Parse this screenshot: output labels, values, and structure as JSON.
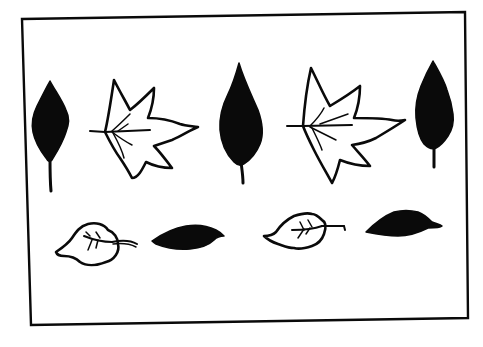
{
  "canvas": {
    "width": 483,
    "height": 347,
    "background": "#ffffff"
  },
  "colors": {
    "ink": "#0a0a0a",
    "paper": "#ffffff"
  },
  "frame": {
    "points": "22,19 465,12 468,318 31,325",
    "stroke_width": 2.4
  },
  "pattern_description": "Two rows of alternating leaves: top row dark oval leaf, outlined maple leaf, dark leaf, outlined maple leaf, dark leaf; bottom row outlined round leaf, dark horizontal leaf, outlined round leaf, dark horizontal leaf",
  "leaves": [
    {
      "name": "dark-leaf-1",
      "kind": "solid",
      "body": "M50,81 C56,92 62,100 66,110 C70,118 69,124 66,132 C63,142 58,150 52,160 C50,162 48,162 46,158 C40,150 35,142 33,132 C31,122 33,114 37,106 C42,96 46,88 50,81 Z",
      "stem": "M50,158 C50,170 50,180 51,191"
    },
    {
      "name": "maple-leaf-1",
      "kind": "outline",
      "body": "M105,132 C108,120 111,100 114,80 C120,92 126,102 130,110 C138,104 146,96 154,88 C154,98 152,108 148,118 C160,118 170,120 180,124 C186,126 192,126 198,127 C190,130 182,136 172,140 C166,142 160,144 154,146 C160,152 166,160 172,168 C164,168 154,166 146,162 C142,170 138,178 132,178 C128,170 124,164 120,158 C114,150 110,142 105,132 Z",
      "veins": [
        "M90,131 L105,132",
        "M105,132 L150,130",
        "M112,131 C120,124 126,118 130,114",
        "M112,132 C120,138 126,142 132,145",
        "M113,133 C118,142 122,150 124,158",
        "M118,131 L128,124"
      ]
    },
    {
      "name": "dark-leaf-2",
      "kind": "solid",
      "body": "M239,63 C244,80 252,96 258,110 C263,124 264,134 260,144 C256,154 250,160 244,164 C241,166 238,166 234,162 C226,154 221,142 220,130 C219,116 223,104 228,94 C233,84 236,74 239,63 Z",
      "stem": "M241,162 C242,170 243,176 243,183"
    },
    {
      "name": "maple-leaf-2",
      "kind": "outline",
      "body": "M303,126 C304,112 306,90 311,68 C318,82 324,96 330,106 C340,100 350,94 360,86 C360,98 358,108 354,118 C368,118 382,118 392,120 C396,121 400,121 405,120 C396,126 386,132 376,138 C368,142 360,144 352,145 C358,152 364,158 370,166 C360,166 350,164 340,160 C338,168 336,176 332,183 C326,172 320,162 314,150 C310,142 306,134 303,126 Z",
      "veins": [
        "M287,126 L303,126",
        "M303,126 L352,125",
        "M310,126 C318,118 322,112 324,108",
        "M310,127 C320,132 328,136 336,140",
        "M312,128 C316,136 320,144 322,150",
        "M320,124 L348,114"
      ]
    },
    {
      "name": "dark-leaf-3",
      "kind": "solid",
      "body": "M433,61 C438,70 444,80 447,90 C450,98 452,106 453,114 C454,122 452,130 448,136 C444,142 440,146 436,148 C432,150 428,148 424,144 C419,138 417,128 416,118 C415,106 417,96 421,86 C425,76 429,68 433,61 Z",
      "stem": "M434,146 C434,154 434,160 434,167"
    },
    {
      "name": "round-leaf-1",
      "kind": "outline",
      "body": "M56,252 C62,248 68,244 72,238 C76,232 80,226 88,224 C96,222 104,224 108,230 C114,232 118,238 118,244 C120,252 114,260 106,262 C96,266 86,266 80,262 C76,258 70,256 64,256 C60,256 57,255 56,252 Z",
      "veins": [
        "M84,236 C94,240 104,242 112,242",
        "M112,242 C122,240 130,240 137,244",
        "M113,244 C122,243 130,244 136,247",
        "M92,240 L88,250",
        "M98,240 L96,248",
        "M90,236 L86,232",
        "M100,238 L96,232"
      ]
    },
    {
      "name": "dark-flat-leaf-1",
      "kind": "solid",
      "body": "M152,241 C162,234 174,228 186,226 C198,224 208,226 216,230 C220,232 222,234 224,236 C218,236 216,238 214,240 C208,246 200,248 190,249 C178,250 166,248 156,244 C154,243 153,242 152,241 Z",
      "stem": ""
    },
    {
      "name": "round-leaf-2",
      "kind": "outline",
      "body": "M264,236 C270,236 274,234 276,232 C280,226 286,220 294,216 C300,214 306,212 312,214 C316,214 320,218 322,220 C326,222 326,228 324,234 C322,240 318,244 312,246 C306,248 300,250 294,248 C288,248 284,246 278,244 C272,242 268,240 264,236 Z",
      "veins": [
        "M292,230 C304,230 314,229 322,226",
        "M322,226 L344,226 L345,230",
        "M304,229 L298,238",
        "M310,228 L306,234",
        "M304,230 L300,222",
        "M312,227 L308,220"
      ]
    },
    {
      "name": "dark-flat-leaf-2",
      "kind": "solid",
      "body": "M366,232 C374,224 384,216 394,212 C402,210 410,210 418,212 C424,214 428,218 432,222 C436,224 440,224 442,226 C440,228 434,228 428,228 C420,232 410,236 398,236 C386,236 376,234 366,232 Z",
      "stem": ""
    }
  ]
}
